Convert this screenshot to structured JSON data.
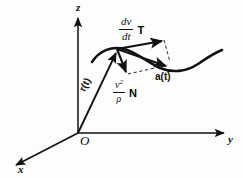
{
  "figure": {
    "background_color": "#fdfdfd",
    "ink_color": "#111111"
  },
  "axes": {
    "z_label": "z",
    "y_label": "y",
    "x_label": "x",
    "origin_label": "O"
  },
  "vectors": {
    "position": {
      "label": "r(t)",
      "description": "position vector from origin to point on curve"
    },
    "tangential": {
      "magnitude_numerator": "dv",
      "magnitude_denominator": "dt",
      "unit_vector_label": "T",
      "description": "tangential component of acceleration"
    },
    "normal": {
      "magnitude_numerator": "v",
      "magnitude_numerator_exponent": "2",
      "magnitude_denominator": "ρ",
      "unit_vector_label": "N",
      "description": "normal component of acceleration"
    },
    "acceleration": {
      "label": "a(t)",
      "description": "resultant acceleration vector"
    }
  },
  "curve": {
    "name": "trajectory-curve",
    "description": "space curve traced by the particle"
  }
}
